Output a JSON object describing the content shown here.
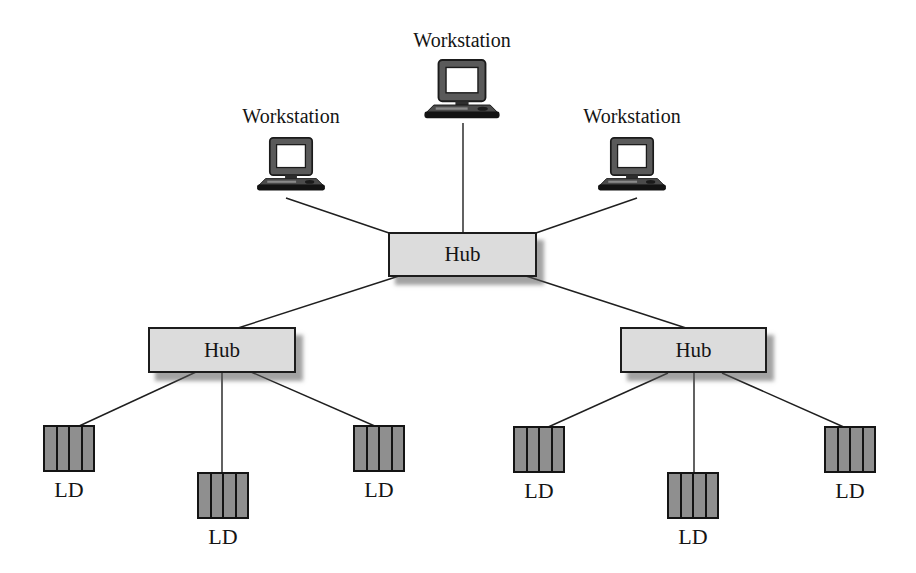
{
  "nodes": {
    "workstations": [
      {
        "label": "Workstation"
      },
      {
        "label": "Workstation"
      },
      {
        "label": "Workstation"
      }
    ],
    "hubs": [
      {
        "label": "Hub"
      },
      {
        "label": "Hub"
      },
      {
        "label": "Hub"
      }
    ],
    "lds": [
      {
        "label": "LD"
      },
      {
        "label": "LD"
      },
      {
        "label": "LD"
      },
      {
        "label": "LD"
      },
      {
        "label": "LD"
      },
      {
        "label": "LD"
      }
    ]
  },
  "connections": [
    {
      "from": "workstation-top",
      "to": "hub-root"
    },
    {
      "from": "workstation-left",
      "to": "hub-root"
    },
    {
      "from": "workstation-right",
      "to": "hub-root"
    },
    {
      "from": "hub-root",
      "to": "hub-left"
    },
    {
      "from": "hub-root",
      "to": "hub-right"
    },
    {
      "from": "hub-left",
      "to": "ld-left-1"
    },
    {
      "from": "hub-left",
      "to": "ld-left-2"
    },
    {
      "from": "hub-left",
      "to": "ld-left-3"
    },
    {
      "from": "hub-right",
      "to": "ld-right-1"
    },
    {
      "from": "hub-right",
      "to": "ld-right-2"
    },
    {
      "from": "hub-right",
      "to": "ld-right-3"
    }
  ],
  "colors": {
    "background": "#ffffff",
    "text": "#141414",
    "line": "#1f1f1f",
    "hub_fill": "#dcdcdc",
    "hub_border": "#1c1c1c",
    "hub_shadow": "#555555",
    "ld_fill": "#8f8f8f",
    "ld_border": "#141414",
    "monitor_frame": "#5a5a5a",
    "screen": "#ffffff",
    "base": "#131313"
  }
}
